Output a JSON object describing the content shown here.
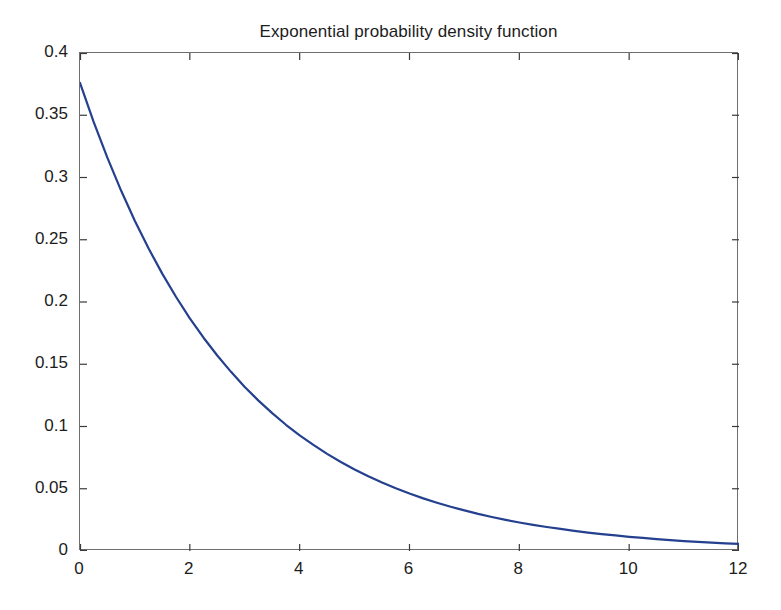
{
  "chart_data": {
    "type": "line",
    "title": "Exponential probability density function",
    "xlabel": "",
    "ylabel": "",
    "xlim": [
      0,
      12
    ],
    "ylim": [
      0,
      0.4
    ],
    "grid": false,
    "legend": null,
    "xticks": [
      "0",
      "2",
      "4",
      "6",
      "8",
      "10",
      "12"
    ],
    "xtick_values": [
      0,
      2,
      4,
      6,
      8,
      10,
      12
    ],
    "yticks": [
      "0",
      "0.05",
      "0.1",
      "0.15",
      "0.2",
      "0.25",
      "0.3",
      "0.35",
      "0.4"
    ],
    "ytick_values": [
      0,
      0.05,
      0.1,
      0.15,
      0.2,
      0.25,
      0.3,
      0.35,
      0.4
    ],
    "series": [
      {
        "name": "exponential pdf",
        "color": "#24408E",
        "linewidth": 2.2,
        "x": [
          0,
          0.25,
          0.5,
          0.75,
          1,
          1.25,
          1.5,
          1.75,
          2,
          2.25,
          2.5,
          2.75,
          3,
          3.25,
          3.5,
          3.75,
          4,
          4.25,
          4.5,
          4.75,
          5,
          5.25,
          5.5,
          5.75,
          6,
          6.25,
          6.5,
          6.75,
          7,
          7.25,
          7.5,
          7.75,
          8,
          8.25,
          8.5,
          8.75,
          9,
          9.25,
          9.5,
          9.75,
          10,
          10.25,
          10.5,
          10.75,
          11,
          11.25,
          11.5,
          11.75,
          12
        ],
        "y": [
          0.376,
          0.3445,
          0.3157,
          0.2893,
          0.2651,
          0.2429,
          0.2226,
          0.204,
          0.1869,
          0.1713,
          0.157,
          0.1439,
          0.1318,
          0.1208,
          0.1107,
          0.1014,
          0.0929,
          0.0852,
          0.078,
          0.0715,
          0.0655,
          0.06,
          0.055,
          0.0504,
          0.0462,
          0.0423,
          0.0388,
          0.0355,
          0.0326,
          0.0298,
          0.0273,
          0.025,
          0.0229,
          0.021,
          0.0193,
          0.0177,
          0.0162,
          0.0148,
          0.0136,
          0.0125,
          0.0114,
          0.0105,
          0.0096,
          0.0088,
          0.008,
          0.0074,
          0.0068,
          0.0062,
          0.0057
        ]
      }
    ]
  },
  "axes": {
    "frame_color": "#6f6f6f",
    "tick_color": "#3a3a3a",
    "background": "#ffffff"
  }
}
